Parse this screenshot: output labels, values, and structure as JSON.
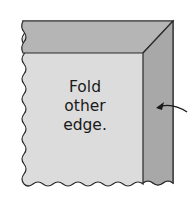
{
  "diagram": {
    "label_lines": [
      "Fold",
      "other",
      "edge."
    ],
    "colors": {
      "fabric": "#dcdcdc",
      "folded_top": "#b5b5b5",
      "folded_side": "#a8a8a8",
      "outline": "#2a2a2a"
    },
    "arrow": {
      "direction": "left",
      "target": "folded-right-edge"
    }
  }
}
